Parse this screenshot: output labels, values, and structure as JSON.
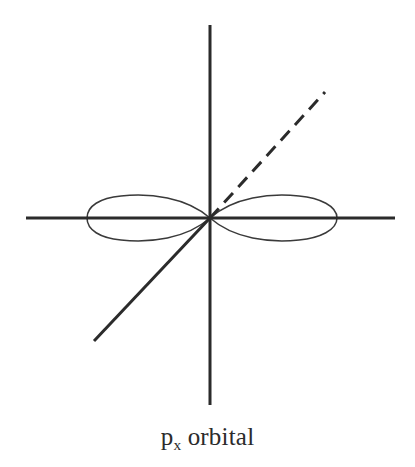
{
  "figure": {
    "caption_base": "p",
    "caption_subscript": "x",
    "caption_rest": "orbital",
    "caption_full": "p_x orbital",
    "background_color": "#ffffff",
    "ink_color": "#2b2b2b",
    "curve_color": "#3a3a3a"
  },
  "chart_data": {
    "type": "line",
    "xlabel": "",
    "ylabel": "",
    "origin": {
      "x": 210,
      "y": 218
    },
    "axes": [
      {
        "name": "vertical-axis",
        "style": "solid",
        "stroke_width": 3,
        "x1": 210,
        "y1": 25,
        "x2": 210,
        "y2": 405
      },
      {
        "name": "horizontal-axis",
        "style": "solid",
        "stroke_width": 3,
        "x1": 26,
        "y1": 218,
        "x2": 395,
        "y2": 218
      },
      {
        "name": "diagonal-axis-solid-lower-left",
        "style": "solid",
        "stroke_width": 3,
        "x1": 210,
        "y1": 218,
        "x2": 94,
        "y2": 341
      },
      {
        "name": "diagonal-axis-dashed-upper-right",
        "style": "dashed",
        "stroke_width": 3,
        "dash_length": 13,
        "dash_gap": 8,
        "x1": 210,
        "y1": 218,
        "x2": 325,
        "y2": 92
      }
    ],
    "lobes": [
      {
        "name": "left-lobe",
        "direction": "negative-x",
        "tip_x": 87,
        "apex_x": 210,
        "max_half_height": 22,
        "stroke_width": 1.5,
        "filled": false
      },
      {
        "name": "right-lobe",
        "direction": "positive-x",
        "tip_x": 337,
        "apex_x": 210,
        "max_half_height": 22,
        "stroke_width": 1.5,
        "filled": false
      }
    ],
    "grid": false,
    "legend": false
  }
}
